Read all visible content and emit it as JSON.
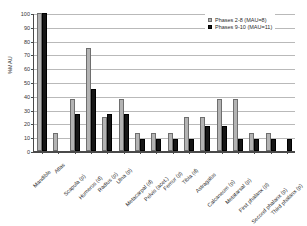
{
  "chart_data": {
    "type": "bar",
    "title": "",
    "xlabel": "",
    "ylabel": "%MAU",
    "ylim": [
      0,
      100
    ],
    "ytick_step": 10,
    "yticks": [
      "100",
      "90",
      "80",
      "70",
      "60",
      "50",
      "40",
      "30",
      "20",
      "10",
      "0"
    ],
    "grid": true,
    "legend_position": "top-right",
    "categories": [
      "Mandible",
      "Atlas",
      "Scapula (p)",
      "Humerus (d)",
      "Radius (p)",
      "Ulna (p)",
      "Metacarpal (d)",
      "Pelvis (acet.)",
      "Femur (p)",
      "Tibia (d)",
      "Astragalus",
      "Calcaneum (p)",
      "Metatarsal (p)",
      "First phalanx (p)",
      "Second phalanx (p)",
      "Third phalanx (p)"
    ],
    "series": [
      {
        "name": "Phases 2-8 (MAU=8)",
        "color": "#b3b3b3",
        "values": [
          100,
          13,
          38,
          75,
          25,
          38,
          13,
          13,
          13,
          25,
          25,
          38,
          38,
          13,
          13,
          0
        ]
      },
      {
        "name": "Phases 9-10 (MAU=11)",
        "color": "#161616",
        "values": [
          100,
          0,
          27,
          45,
          27,
          27,
          9,
          9,
          9,
          9,
          18,
          18,
          9,
          9,
          9,
          9
        ]
      }
    ]
  },
  "legend": {
    "items": [
      {
        "label": "Phases 2-8 (MAU=8)",
        "swatch": "legend-swatch-gray"
      },
      {
        "label": "Phases 9-10 (MAU=11)",
        "swatch": "legend-swatch-black"
      }
    ]
  }
}
